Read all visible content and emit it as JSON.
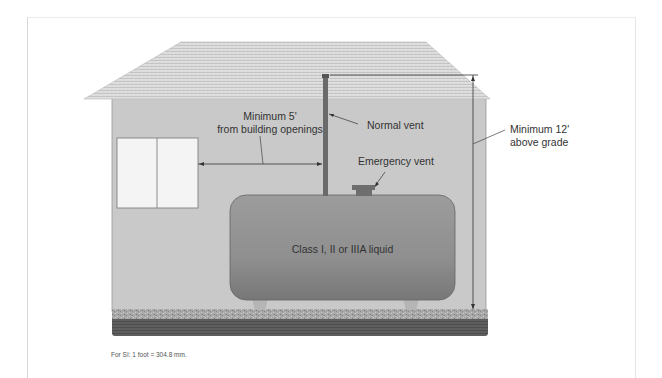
{
  "diagram": {
    "type": "building-tank-vent-clearance",
    "labels": {
      "min_5": "Minimum 5'",
      "from_openings": "from building openings",
      "normal_vent": "Normal vent",
      "emergency_vent": "Emergency vent",
      "min_12": "Minimum 12'",
      "above_grade": "above grade",
      "tank": "Class I, II or IIIA liquid"
    },
    "footnote": "For SI: 1 foot = 304.8 mm.",
    "colors": {
      "wall": "#c9c9c9",
      "roof": "#d8d8d8",
      "tank": "#8e8e8e",
      "vent_pipe": "#6a6a6a",
      "gravel": "#a7a7a7",
      "ground": "#5e5e5e",
      "window": "#f4f4f4"
    }
  }
}
